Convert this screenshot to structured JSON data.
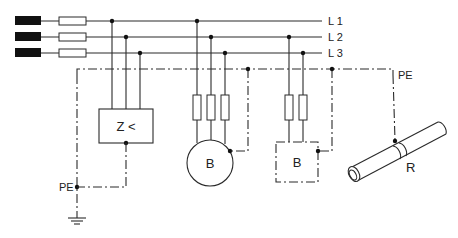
{
  "diagram": {
    "type": "electrical-schematic",
    "lines": [
      {
        "id": "L1",
        "label": "L 1"
      },
      {
        "id": "L2",
        "label": "L 2"
      },
      {
        "id": "L3",
        "label": "L 3"
      }
    ],
    "protective_earth": {
      "label_top": "PE",
      "label_left": "PE"
    },
    "components": {
      "impedance_monitor": {
        "label": "Z <"
      },
      "motor": {
        "label": "B"
      },
      "equipment": {
        "label": "B"
      },
      "pipe": {
        "label": "R"
      }
    }
  }
}
